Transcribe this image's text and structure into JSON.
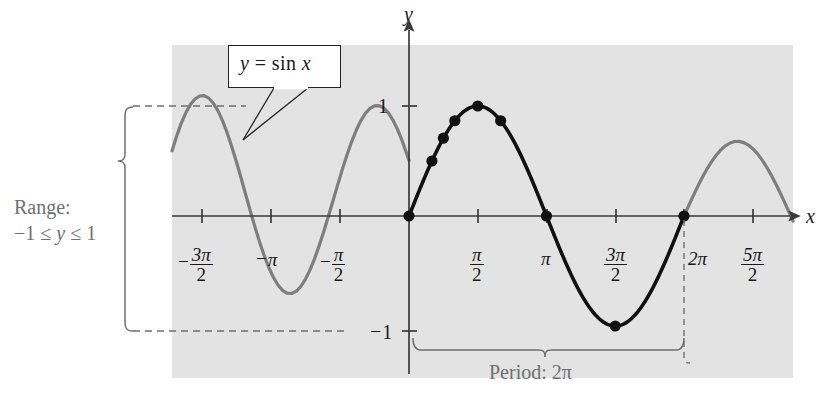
{
  "figure": {
    "panel_fill": "#e3e3e3",
    "curve_highlight_color": "#111111",
    "curve_muted_color": "#7e7e7e",
    "axis_color": "#3a3a3a",
    "annotation_color": "#6f6f6f",
    "callout": {
      "equation_y": "y",
      "equation_eq": "=",
      "equation_rhs": "sin",
      "equation_var": "x",
      "full_text": "y = sin x"
    },
    "axes": {
      "x_axis_label": "x",
      "y_axis_label": "y",
      "y_ticks": [
        {
          "label": "1",
          "value": 1
        },
        {
          "label": "-1",
          "value": -1
        }
      ],
      "x_ticks": [
        {
          "num": "3π",
          "den": "2",
          "sign": "−",
          "plain": "-3π/2",
          "value": -4.71238898038469
        },
        {
          "num": "π",
          "den": "",
          "sign": "−",
          "plain": "-π",
          "value": -3.141592653589793
        },
        {
          "num": "π",
          "den": "2",
          "sign": "−",
          "plain": "-π/2",
          "value": -1.570796326794897
        },
        {
          "num": "π",
          "den": "2",
          "sign": "",
          "plain": "π/2",
          "value": 1.570796326794897
        },
        {
          "num": "π",
          "den": "",
          "sign": "",
          "plain": "π",
          "value": 3.141592653589793
        },
        {
          "num": "3π",
          "den": "2",
          "sign": "",
          "plain": "3π/2",
          "value": 4.71238898038469
        },
        {
          "num": "2π",
          "den": "",
          "sign": "",
          "plain": "2π",
          "value": 6.283185307179586
        },
        {
          "num": "5π",
          "den": "2",
          "sign": "",
          "plain": "5π/2",
          "value": 7.853981633974483
        }
      ]
    },
    "annotations": {
      "range_line1": "Range:",
      "range_line2_neg": "−1",
      "range_line2_le1": "≤",
      "range_line2_var": "y",
      "range_line2_le2": "≤",
      "range_line2_one": "1",
      "range_full": "Range: −1 ≤ y ≤ 1",
      "period_label": "Period:",
      "period_value": "2π",
      "period_full": "Period: 2π"
    }
  },
  "chart_data": {
    "type": "line",
    "xlabel": "x",
    "ylabel": "y",
    "function": "y = sin(x)",
    "xlim": [
      -5.4978,
      8.6394
    ],
    "ylim": [
      -1.35,
      1.35
    ],
    "grid": false,
    "legend": null,
    "amplitude": 1,
    "period": 6.283185307179586,
    "range": [
      -1,
      1
    ],
    "domain_highlighted": [
      0,
      6.283185307179586
    ],
    "x_tick_values": [
      -4.71238898,
      -3.14159265,
      -1.57079633,
      1.57079633,
      3.14159265,
      4.71238898,
      6.28318531,
      7.85398163
    ],
    "x_tick_labels": [
      "-3π/2",
      "-π",
      "-π/2",
      "π/2",
      "π",
      "3π/2",
      "2π",
      "5π/2"
    ],
    "y_tick_values": [
      1,
      -1
    ],
    "y_tick_labels": [
      "1",
      "-1"
    ],
    "series": [
      {
        "name": "sin x (highlighted period)",
        "color": "#111111",
        "x_start": 0,
        "x_end": 6.283185307179586
      },
      {
        "name": "sin x (extended)",
        "color": "#7e7e7e",
        "x_start": -5.4978,
        "x_end": 8.6394
      }
    ],
    "marked_points": [
      {
        "x": 0,
        "x_label": "0",
        "y": 0.0
      },
      {
        "x": 0.5235988,
        "x_label": "π/6",
        "y": 0.5
      },
      {
        "x": 0.7853982,
        "x_label": "π/4",
        "y": 0.7071
      },
      {
        "x": 1.0471976,
        "x_label": "π/3",
        "y": 0.866
      },
      {
        "x": 1.5707963,
        "x_label": "π/2",
        "y": 1.0
      },
      {
        "x": 2.0943951,
        "x_label": "2π/3",
        "y": 0.866
      },
      {
        "x": 3.1415927,
        "x_label": "π",
        "y": 0.0
      },
      {
        "x": 4.712389,
        "x_label": "3π/2",
        "y": -1.0
      },
      {
        "x": 6.2831853,
        "x_label": "2π",
        "y": 0.0
      }
    ]
  }
}
